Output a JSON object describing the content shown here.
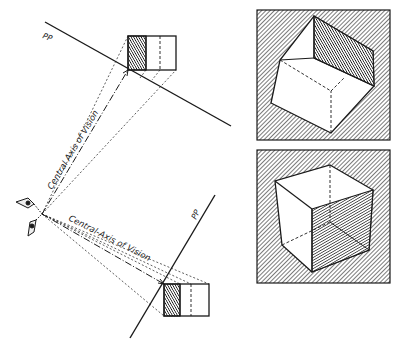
{
  "diagram": {
    "left_panel": {
      "upper_view": {
        "picture_plane_label": "PP",
        "axis_label": "Central Axis of Vision"
      },
      "lower_view": {
        "picture_plane_label": "PP",
        "axis_label": "Central-Axis of Vision"
      },
      "station_point_icon": "eye-icon"
    },
    "right_panel": {
      "top_cube": {
        "description": "cube seen from above, right face shaded dark"
      },
      "bottom_cube": {
        "description": "cube seen at eye level, right front face shaded dark"
      }
    },
    "colors": {
      "ink": "#1a1a1a",
      "hatch": "#555555",
      "paper": "#ffffff"
    }
  }
}
